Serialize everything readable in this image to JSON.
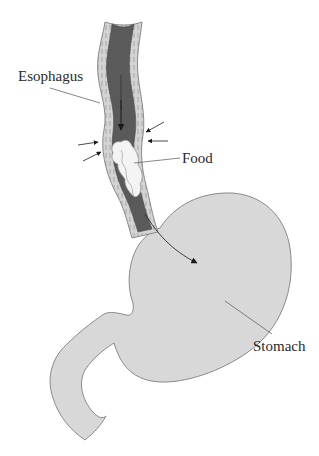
{
  "figure": {
    "labels": {
      "esophagus": "Esophagus",
      "food": "Food",
      "stomach": "Stomach"
    },
    "colors": {
      "background": "#ffffff",
      "esophagus_wall": "#d4d4d4",
      "esophagus_lumen": "#5a5a5a",
      "stomach_fill": "#d8d8d8",
      "outline": "#8a8a8a",
      "food_fill": "#f4f4f4",
      "arrows": "#1a1a1a",
      "leader_lines": "#555555"
    },
    "arrows": {
      "food_direction": "down-into-stomach",
      "contraction_arrows_left": 2,
      "contraction_arrows_right": 2
    }
  }
}
